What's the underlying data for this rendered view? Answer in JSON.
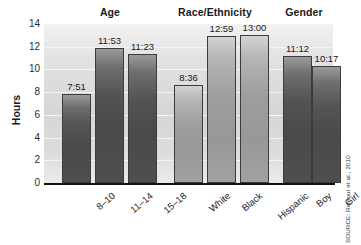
{
  "chart_data": {
    "type": "bar",
    "title": "",
    "xlabel": "",
    "ylabel": "Hours",
    "ylim": [
      0,
      14
    ],
    "yticks": [
      0,
      2,
      4,
      6,
      8,
      10,
      12,
      14
    ],
    "grid": true,
    "legend": null,
    "groups": [
      {
        "name": "Age",
        "categories": [
          "8–10",
          "11–14",
          "15–18"
        ],
        "values": [
          7.85,
          11.883,
          11.383
        ],
        "labels": [
          "7:51",
          "11:53",
          "11:23"
        ],
        "color": "#4e4e4e"
      },
      {
        "name": "Race/Ethnicity",
        "categories": [
          "White",
          "Black",
          "Hispanic"
        ],
        "values": [
          8.6,
          12.983,
          13.0
        ],
        "labels": [
          "8:36",
          "12:59",
          "13:00"
        ],
        "color": "#9d9d9d"
      },
      {
        "name": "Gender",
        "categories": [
          "Boy",
          "Girl"
        ],
        "values": [
          11.2,
          10.283
        ],
        "labels": [
          "11:12",
          "10:17"
        ],
        "color": "#4e4e4e"
      }
    ]
  },
  "axes": {
    "y_title": "Hours",
    "y_tick_labels": [
      "14",
      "12",
      "10",
      "8",
      "6",
      "4",
      "2",
      "0"
    ]
  },
  "group_titles": [
    "Age",
    "Race/Ethnicity",
    "Gender"
  ],
  "bars": [
    {
      "label": "7:51",
      "category": "8–10",
      "group": "Age"
    },
    {
      "label": "11:53",
      "category": "11–14",
      "group": "Age"
    },
    {
      "label": "11:23",
      "category": "15–18",
      "group": "Age"
    },
    {
      "label": "8:36",
      "category": "White",
      "group": "Race/Ethnicity"
    },
    {
      "label": "12:59",
      "category": "Black",
      "group": "Race/Ethnicity"
    },
    {
      "label": "13:00",
      "category": "Hispanic",
      "group": "Race/Ethnicity"
    },
    {
      "label": "11:12",
      "category": "Boy",
      "group": "Gender"
    },
    {
      "label": "10:17",
      "category": "Girl",
      "group": "Gender"
    }
  ],
  "source": {
    "text": "SOURCE: Rideout et al., 2010"
  },
  "colors": {
    "bar_dark": "#4e4e4e",
    "bar_light": "#9d9d9d",
    "plot_background": "#dcdcdc",
    "axis": "#111111",
    "gridline": "#f4f4f4",
    "text": "#1a1a1a"
  }
}
